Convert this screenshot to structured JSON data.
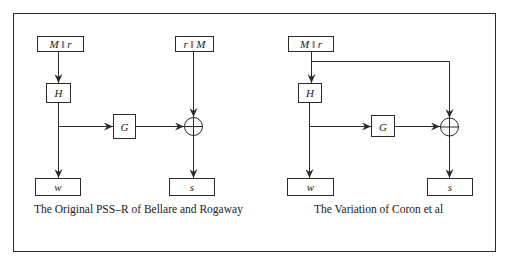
{
  "colors": {
    "stroke": "#2a2a2a",
    "text": "#1a1a1a",
    "background": "#ffffff"
  },
  "left_diagram": {
    "caption": "The Original PSS–R of Bellare and Rogaway",
    "input_box": "M ‖ r",
    "second_input_box": "r ‖ M",
    "hash_box": "H",
    "mask_box": "G",
    "xor_symbol": "⊕",
    "output_w": "w",
    "output_s": "s"
  },
  "right_diagram": {
    "caption": "The Variation of Coron et al",
    "input_box": "M ‖ r",
    "hash_box": "H",
    "mask_box": "G",
    "xor_symbol": "⊕",
    "output_w": "w",
    "output_s": "s"
  }
}
